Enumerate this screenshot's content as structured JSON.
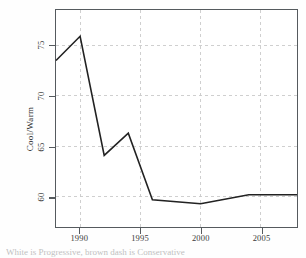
{
  "chart_data": {
    "type": "line",
    "title": "",
    "xlabel": "",
    "ylabel": "Cool/Warm",
    "x": [
      1988,
      1990,
      1992,
      1994,
      1996,
      2000,
      2004,
      2008
    ],
    "values": [
      73.5,
      75.9,
      64.1,
      66.3,
      59.7,
      59.3,
      60.2,
      60.2
    ],
    "series": [
      {
        "name": "Cool/Warm",
        "values": [
          73.5,
          75.9,
          64.1,
          66.3,
          59.7,
          59.3,
          60.2,
          60.2
        ]
      }
    ],
    "xlim": [
      1988,
      2008
    ],
    "ylim": [
      57.0,
      78.5
    ],
    "x_ticks": [
      1990,
      1995,
      2000,
      2005
    ],
    "x_tick_labels": [
      "1990",
      "1995",
      "2000",
      "2005"
    ],
    "y_ticks": [
      60,
      65,
      70,
      75
    ],
    "y_tick_labels": [
      "60",
      "65",
      "70",
      "75"
    ],
    "grid": true,
    "grid_style": "dashed",
    "legend": "none",
    "line_color": "#222222",
    "grid_color": "#c9c9c9",
    "axis_color": "#555a5e",
    "background_color": "#ffffff"
  },
  "caption": {
    "text": "White is Progressive, brown dash is Conservative"
  }
}
